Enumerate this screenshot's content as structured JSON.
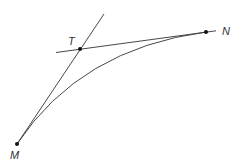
{
  "diagram": {
    "type": "geometry",
    "points": [
      {
        "id": "M",
        "label": "M",
        "x": 17,
        "y": 144
      },
      {
        "id": "T",
        "label": "T",
        "x": 80,
        "y": 49
      },
      {
        "id": "N",
        "label": "N",
        "x": 206,
        "y": 32
      }
    ],
    "lines": [
      {
        "id": "tangent-M",
        "from": "M",
        "through": "T"
      },
      {
        "id": "tangent-N",
        "from": "N",
        "through": "T"
      }
    ],
    "curve": {
      "from": "M",
      "to": "N",
      "control": "T"
    },
    "colors": {
      "stroke": "#333333",
      "point": "#111111",
      "label": "#333333"
    }
  }
}
